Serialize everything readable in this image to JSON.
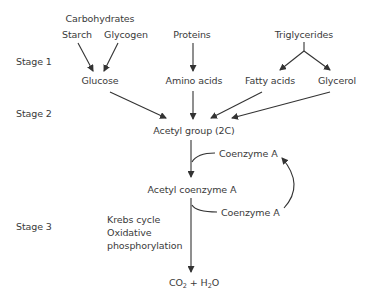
{
  "stages": [
    "Stage 1",
    "Stage 2",
    "Stage 3"
  ],
  "nodes": {
    "carbohydrates": "Carbohydrates",
    "starch": "Starch",
    "glycogen": "Glycogen",
    "proteins": "Proteins",
    "triglycerides": "Triglycerides",
    "glucose": "Glucose",
    "amino_acids": "Amino acids",
    "fatty_acids": "Fatty acids",
    "glycerol": "Glycerol",
    "acetyl_group": "Acetyl group (2C)",
    "coenzyme_a_in": "Coenzyme A",
    "acetyl_coa": "Acetyl coenzyme A",
    "coenzyme_a_out": "Coenzyme A",
    "krebs_lines": [
      "Krebs cycle",
      "Oxidative",
      "phosphorylation"
    ],
    "products": {
      "co": "CO",
      "co_sub": "2",
      "plus_h": " + H",
      "h_sub": "2",
      "o": "O"
    }
  },
  "colors": {
    "line": "#333333",
    "text": "#3a3a3a"
  }
}
